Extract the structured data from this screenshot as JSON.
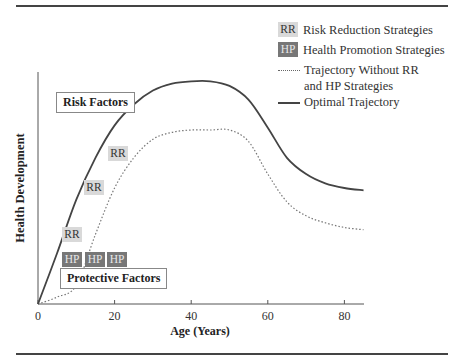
{
  "legend": {
    "items": [
      {
        "chip": "RR",
        "label": "Risk Reduction Strategies",
        "style": "chip-light"
      },
      {
        "chip": "HP",
        "label": "Health Promotion Strategies",
        "style": "chip-dark"
      },
      {
        "label_line1": "Trajectory Without RR",
        "label_line2": "and HP Strategies",
        "style": "dotted-line"
      },
      {
        "label": "Optimal Trajectory",
        "style": "solid-line"
      }
    ]
  },
  "annotations": {
    "risk_factors": "Risk Factors",
    "protective_factors": "Protective Factors",
    "rr_tags": [
      "RR",
      "RR",
      "RR"
    ],
    "hp_tags": [
      "HP",
      "HP",
      "HP"
    ]
  },
  "colors": {
    "rr_chip": "#d9d9d9",
    "hp_chip": "#777777",
    "optimal_line": "#444444",
    "without_line": "#777777"
  },
  "chart_data": {
    "type": "line",
    "title": "",
    "xlabel": "Age (Years)",
    "ylabel": "Health Development",
    "x_ticks": [
      0,
      20,
      40,
      60,
      80
    ],
    "xlim": [
      0,
      85
    ],
    "ylim": [
      0,
      100
    ],
    "y_ticks": [],
    "grid": false,
    "legend_position": "top-right",
    "x": [
      0,
      5,
      10,
      15,
      20,
      25,
      30,
      35,
      40,
      45,
      50,
      55,
      60,
      65,
      70,
      75,
      80,
      85
    ],
    "series": [
      {
        "name": "Optimal Trajectory",
        "style": "solid",
        "values": [
          0,
          22,
          45,
          63,
          77,
          86,
          92,
          95,
          96,
          96,
          94,
          88,
          76,
          63,
          56,
          52,
          50,
          49
        ]
      },
      {
        "name": "Trajectory Without RR and HP Strategies",
        "style": "dotted",
        "values": [
          0,
          3,
          8,
          30,
          50,
          63,
          71,
          74,
          75,
          75,
          75,
          70,
          56,
          44,
          38,
          35,
          33,
          32
        ]
      }
    ],
    "annotations": [
      "Risk Factors",
      "Protective Factors",
      "RR",
      "RR",
      "RR",
      "HP",
      "HP",
      "HP"
    ]
  }
}
